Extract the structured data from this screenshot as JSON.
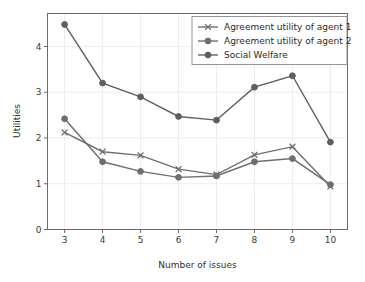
{
  "chart_data": {
    "type": "line",
    "title": "",
    "xlabel": "Number of issues",
    "ylabel": "Utilities",
    "categories": [
      3,
      4,
      5,
      6,
      7,
      8,
      9,
      10
    ],
    "x": [
      3,
      4,
      5,
      6,
      7,
      8,
      9,
      10
    ],
    "xlim": [
      2.55,
      10.45
    ],
    "ylim": [
      0,
      4.72
    ],
    "xticks": [
      "3",
      "4",
      "5",
      "6",
      "7",
      "8",
      "9",
      "10"
    ],
    "yticks": [
      "0",
      "1",
      "2",
      "3",
      "4"
    ],
    "ytick_values": [
      0,
      1,
      2,
      3,
      4
    ],
    "grid": true,
    "legend_position": "upper right",
    "series": [
      {
        "name": "Agreement utility of agent 1",
        "marker": "x",
        "color": "#6e6e6e",
        "values": [
          2.12,
          1.7,
          1.62,
          1.32,
          1.2,
          1.63,
          1.81,
          0.94
        ]
      },
      {
        "name": "Agreement utility of agent 2",
        "marker": "o",
        "color": "#6e6e6e",
        "values": [
          2.42,
          1.48,
          1.27,
          1.14,
          1.17,
          1.48,
          1.55,
          0.98
        ]
      },
      {
        "name": "Social Welfare",
        "marker": "o",
        "color": "#5f5f5f",
        "values": [
          4.48,
          3.2,
          2.9,
          2.47,
          2.39,
          3.11,
          3.36,
          1.91
        ]
      }
    ]
  },
  "legend": {
    "entries": [
      "Agreement utility of agent 1",
      "Agreement utility of agent 2",
      "Social Welfare"
    ]
  },
  "colors": {
    "line_gray": "#6e6e6e",
    "frame": "#6b6b6b",
    "grid": "#eceaea",
    "text": "#2f2f2f",
    "background": "#ffffff"
  }
}
